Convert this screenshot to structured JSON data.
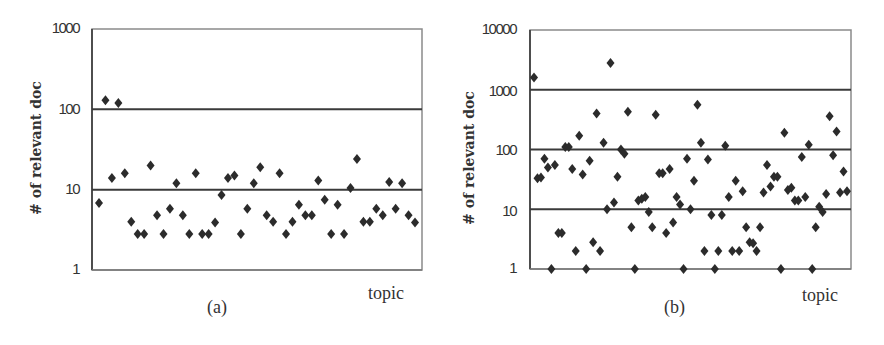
{
  "chart_data": [
    {
      "type": "scatter",
      "caption": "(a)",
      "title": "",
      "xlabel": "topic",
      "ylabel": "# of relevant doc",
      "yscale": "log",
      "ylim": [
        1,
        1000
      ],
      "yticks": [
        "1000",
        "100",
        "10",
        "1"
      ],
      "grid": "horizontal lines at 10 and 100",
      "legend": null,
      "x": [
        1,
        2,
        3,
        4,
        5,
        6,
        7,
        8,
        9,
        10,
        11,
        12,
        13,
        14,
        15,
        16,
        17,
        18,
        19,
        20,
        21,
        22,
        23,
        24,
        25,
        26,
        27,
        28,
        29,
        30,
        31,
        32,
        33,
        34,
        35,
        36,
        37,
        38,
        39,
        40,
        41,
        42,
        43,
        44,
        45,
        46,
        47,
        48,
        49,
        50
      ],
      "values": [
        6.8,
        130,
        14,
        120,
        16,
        4,
        2.8,
        2.8,
        20,
        4.8,
        2.8,
        5.8,
        12,
        4.8,
        2.8,
        16,
        2.8,
        2.8,
        3.9,
        8.6,
        14,
        15,
        2.8,
        5.8,
        12,
        19,
        4.8,
        4,
        16,
        2.8,
        4,
        6.5,
        4.8,
        4.8,
        13,
        7.5,
        2.8,
        6.5,
        2.8,
        10.5,
        24,
        4,
        4,
        5.8,
        4.8,
        12.5,
        5.8,
        12,
        4.8,
        3.9
      ]
    },
    {
      "type": "scatter",
      "caption": "(b)",
      "title": "",
      "xlabel": "topic",
      "ylabel": "# of relevant doc",
      "yscale": "log",
      "ylim": [
        1,
        10000
      ],
      "yticks": [
        "10000",
        "1000",
        "100",
        "10",
        "1"
      ],
      "grid": "horizontal lines at 10, 100 and 1000",
      "legend": null,
      "x": [
        1,
        2,
        3,
        4,
        5,
        6,
        7,
        8,
        9,
        10,
        11,
        12,
        13,
        14,
        15,
        16,
        17,
        18,
        19,
        20,
        21,
        22,
        23,
        24,
        25,
        26,
        27,
        28,
        29,
        30,
        31,
        32,
        33,
        34,
        35,
        36,
        37,
        38,
        39,
        40,
        41,
        42,
        43,
        44,
        45,
        46,
        47,
        48,
        49,
        50,
        51,
        52,
        53,
        54,
        55,
        56,
        57,
        58,
        59,
        60,
        61,
        62,
        63,
        64,
        65,
        66,
        67,
        68,
        69,
        70,
        71,
        72,
        73,
        74,
        75,
        76,
        77,
        78,
        79,
        80,
        81,
        82,
        83,
        84,
        85,
        86,
        87,
        88,
        89,
        90,
        91
      ],
      "values": [
        1600,
        33,
        34,
        70,
        50,
        1,
        55,
        4,
        4,
        110,
        110,
        47,
        2,
        170,
        38,
        1,
        65,
        2.8,
        400,
        2,
        130,
        10,
        2800,
        13,
        35,
        100,
        85,
        430,
        5,
        1,
        14,
        15,
        16,
        9,
        5,
        380,
        40,
        40,
        4,
        47,
        6,
        16,
        12,
        1,
        70,
        10,
        30,
        560,
        130,
        2,
        68,
        8,
        1,
        2,
        8,
        115,
        16,
        2,
        30,
        2,
        20,
        5,
        2.8,
        2.7,
        2,
        5,
        19,
        55,
        24,
        35,
        35,
        1,
        190,
        21,
        23,
        14,
        14,
        75,
        16,
        120,
        1,
        5,
        11,
        9,
        18,
        360,
        80,
        200,
        19,
        43,
        20
      ]
    }
  ],
  "panels": {
    "a": {
      "caption": "(a)",
      "xlabel": "topic",
      "ylabel": "# of relevant doc",
      "ticks": [
        "1000",
        "100",
        "10",
        "1"
      ]
    },
    "b": {
      "caption": "(b)",
      "xlabel": "topic",
      "ylabel": "# of relevant doc",
      "ticks": [
        "10000",
        "1000",
        "100",
        "10",
        "1"
      ]
    }
  },
  "colors": {
    "marker": "#2b2b2b",
    "gridline": "#3a3a3a",
    "frame": "#8a8a8a",
    "text": "#333333"
  }
}
